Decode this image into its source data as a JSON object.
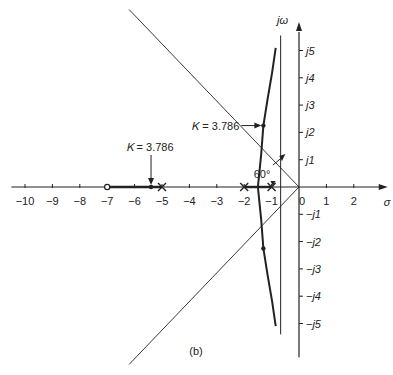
{
  "chart_data": {
    "type": "root-locus",
    "caption": "(b)",
    "xlabel": "σ",
    "ylabel": "jω",
    "xlim": [
      -10.5,
      2.8
    ],
    "ylim": [
      -5.8,
      5.9
    ],
    "x_ticks": [
      "-10",
      "-9",
      "-8",
      "-7",
      "-6",
      "-5",
      "-4",
      "-3",
      "-2",
      "-1",
      "0",
      "1",
      "2"
    ],
    "x_tick_values": [
      -10,
      -9,
      -8,
      -7,
      -6,
      -5,
      -4,
      -3,
      -2,
      -1,
      0,
      1,
      2
    ],
    "y_ticks": [
      "j1",
      "j2",
      "j3",
      "j4",
      "j5",
      "-j1",
      "-j2",
      "-j3",
      "-j4",
      "-j5"
    ],
    "y_tick_values": [
      1,
      2,
      3,
      4,
      5,
      -1,
      -2,
      -3,
      -4,
      -5
    ],
    "poles": [
      -5,
      -2,
      -1
    ],
    "zeros": [
      -7
    ],
    "asymptote_sigma": -0.67,
    "asymptote_angle_label": "60°",
    "annotations": [
      {
        "text": "K = 3.786",
        "point": [
          -5.4,
          0
        ]
      },
      {
        "text": "K = 3.786",
        "point": [
          -1.3,
          2.25
        ]
      }
    ],
    "real_axis_locus": [
      [
        -7,
        -5
      ],
      [
        -2,
        -1
      ]
    ],
    "complex_branch_upper": [
      [
        -1.5,
        0
      ],
      [
        -1.45,
        0.5
      ],
      [
        -1.38,
        1.2
      ],
      [
        -1.3,
        2.25
      ],
      [
        -1.15,
        3.2
      ],
      [
        -0.98,
        4.2
      ],
      [
        -0.85,
        5.1
      ]
    ],
    "damping_line_points": [
      [
        -6.2,
        6.5
      ],
      [
        0,
        0
      ],
      [
        -6.2,
        -6.5
      ]
    ],
    "marked_points": [
      [
        -1.3,
        2.25
      ],
      [
        -1.3,
        -2.25
      ],
      [
        -5.4,
        0
      ]
    ]
  }
}
